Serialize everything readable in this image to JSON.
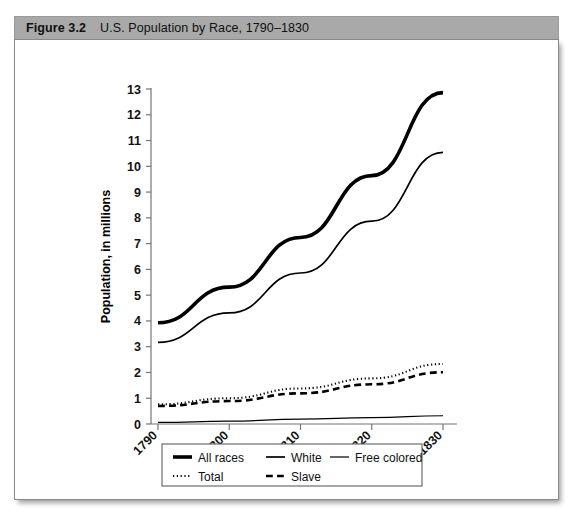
{
  "figure": {
    "label": "Figure 3.2",
    "title": "U.S. Population by Race, 1790–1830"
  },
  "chart_data": {
    "type": "line",
    "title": "U.S. Population by Race, 1790–1830",
    "xlabel": "Years",
    "ylabel": "Population, in millions",
    "x": [
      1790,
      1800,
      1810,
      1820,
      1830
    ],
    "xtick_labels": [
      "1790",
      "1800",
      "1810",
      "1820",
      "1830"
    ],
    "ytick_labels": [
      "0",
      "1",
      "2",
      "3",
      "4",
      "5",
      "6",
      "7",
      "8",
      "9",
      "10",
      "11",
      "12",
      "13"
    ],
    "ylim": [
      0,
      13
    ],
    "ytick_step": 1,
    "grid": false,
    "legend_position": "bottom",
    "series": [
      {
        "name": "All races",
        "values": [
          3.93,
          5.31,
          7.24,
          9.64,
          12.86
        ],
        "style": "solid",
        "width": 3.6,
        "color": "#000000"
      },
      {
        "name": "White",
        "values": [
          3.17,
          4.31,
          5.86,
          7.87,
          10.54
        ],
        "style": "solid",
        "width": 1.7,
        "color": "#000000"
      },
      {
        "name": "Free colored",
        "values": [
          0.06,
          0.11,
          0.19,
          0.25,
          0.32
        ],
        "style": "solid",
        "width": 1.2,
        "color": "#7a7a7a"
      },
      {
        "name": "Total",
        "values": [
          0.76,
          1.0,
          1.38,
          1.77,
          2.33
        ],
        "style": "dotted",
        "width": 2.1,
        "color": "#000000"
      },
      {
        "name": "Slave",
        "values": [
          0.7,
          0.89,
          1.19,
          1.54,
          2.01
        ],
        "style": "dashed",
        "width": 2.6,
        "color": "#000000"
      }
    ]
  },
  "legend": {
    "rows": [
      [
        "All races",
        "White",
        "Free colored"
      ],
      [
        "Total",
        "Slave"
      ]
    ]
  }
}
